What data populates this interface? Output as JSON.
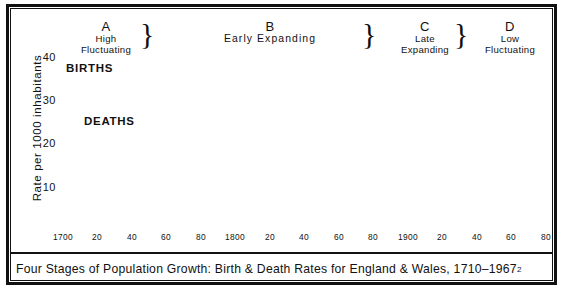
{
  "figure": {
    "caption_text": "Four Stages of Population Growth: Birth & Death Rates for England & Wales, 1710–1967",
    "caption_footnote": "2"
  },
  "axes": {
    "y_axis_title": "Rate per 1000 inhabitants",
    "y_ticks": [
      "40",
      "30",
      "20",
      "10"
    ],
    "y_tick_values": [
      40,
      30,
      20,
      10
    ],
    "y_min": 0,
    "y_max": 45,
    "x_ticks": [
      "1700",
      "20",
      "40",
      "60",
      "80",
      "1800",
      "20",
      "40",
      "60",
      "80",
      "1900",
      "20",
      "40",
      "60",
      "80"
    ],
    "x_tick_values": [
      1700,
      1720,
      1740,
      1760,
      1780,
      1800,
      1820,
      1840,
      1860,
      1880,
      1900,
      1920,
      1940,
      1960,
      1980
    ],
    "x_min": 1700,
    "x_max": 1980,
    "grid": "on",
    "grid_x_step": 20,
    "grid_y_step": 10
  },
  "stages": [
    {
      "letter": "A",
      "name_line1": "High",
      "name_line2": "Fluctuating",
      "center_year": 1730,
      "end_year": 1760
    },
    {
      "letter": "B",
      "name_line1": "Early",
      "name_line2": "Expanding",
      "inline": "Early  Expanding",
      "center_year": 1845,
      "end_year": 1885
    },
    {
      "letter": "C",
      "name_line1": "Late",
      "name_line2": "Expanding",
      "center_year": 1910,
      "end_year": 1931
    },
    {
      "letter": "D",
      "name_line1": "Low",
      "name_line2": "Fluctuating",
      "center_year": 1955,
      "end_year": 1980
    }
  ],
  "braces": [
    {
      "at_year": 1760
    },
    {
      "at_year": 1885
    },
    {
      "at_year": 1931
    }
  ],
  "annotations": [
    {
      "label": "BIRTHS",
      "points_to_year": 1748,
      "points_to_value": 36.6
    },
    {
      "label": "DEATHS",
      "points_to_year": 1760,
      "points_to_value": 30.2
    }
  ],
  "chart_data": {
    "type": "area",
    "title": "Four Stages of Population Growth: Birth & Death Rates for England & Wales, 1710–1967",
    "xlabel": "",
    "ylabel": "Rate per 1000 inhabitants",
    "xlim": [
      1700,
      1980
    ],
    "ylim": [
      0,
      45
    ],
    "legend": [
      "BIRTHS",
      "DEATHS"
    ],
    "legend_position": "inline-annotation",
    "fill_between": true,
    "fill_color": "#8a8a8a",
    "x": [
      1710,
      1720,
      1740,
      1750,
      1760,
      1770,
      1780,
      1790,
      1800,
      1810,
      1820,
      1830,
      1840,
      1850,
      1860,
      1870,
      1880,
      1890,
      1900,
      1910,
      1920,
      1930,
      1940,
      1950,
      1960,
      1967
    ],
    "series": [
      {
        "name": "BIRTHS",
        "values": [
          31.0,
          31.5,
          35.2,
          36.6,
          36.8,
          36.9,
          37.2,
          37.6,
          37.4,
          37.3,
          37.0,
          36.5,
          36.3,
          32.3,
          34.3,
          35.2,
          34.1,
          30.2,
          28.7,
          25.5,
          21.0,
          16.3,
          13.5,
          15.4,
          15.6,
          15.5
        ],
        "color": "#111111"
      },
      {
        "name": "DEATHS",
        "values": [
          29.2,
          30.0,
          31.0,
          30.8,
          30.2,
          30.5,
          31.0,
          29.0,
          26.0,
          23.5,
          20.3,
          22.0,
          22.9,
          21.4,
          22.6,
          22.0,
          20.0,
          19.0,
          18.3,
          14.9,
          12.5,
          11.4,
          11.8,
          11.7,
          11.5,
          10.2
        ],
        "color": "#111111"
      }
    ]
  },
  "colors": {
    "ink": "#111111",
    "band_fill": "#8a8a8a",
    "grid": "#4a4a4a",
    "paper": "#ffffff"
  }
}
